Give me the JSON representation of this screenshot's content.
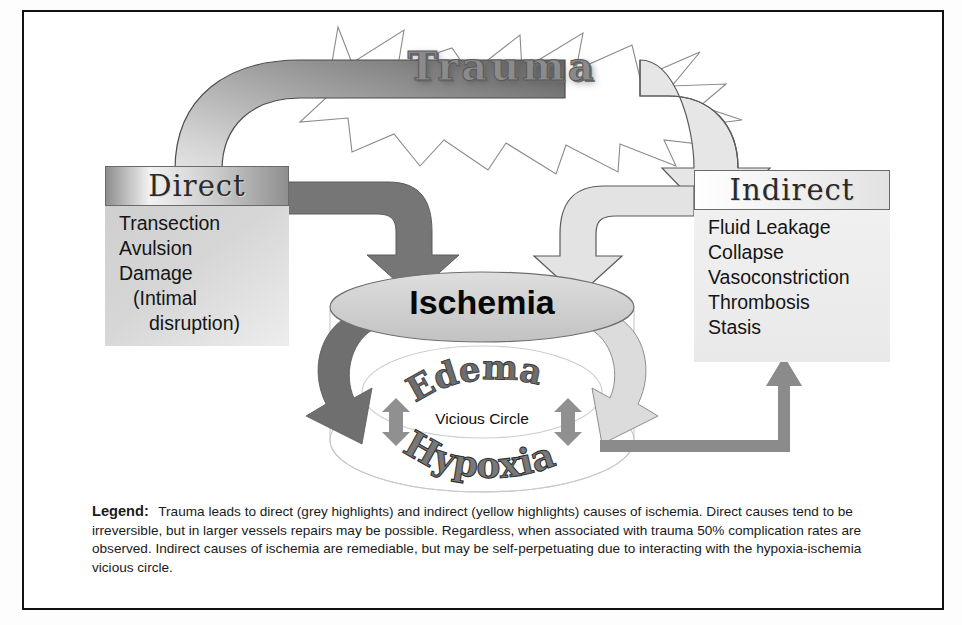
{
  "title": {
    "text": "Trauma"
  },
  "direct": {
    "header": "Direct",
    "items": [
      "Transection",
      "Avulsion",
      "Damage",
      "(Intimal",
      "disruption)"
    ]
  },
  "indirect": {
    "header": "Indirect",
    "items": [
      "Fluid Leakage",
      "Collapse",
      "Vasoconstriction",
      "Thrombosis",
      "Stasis"
    ]
  },
  "center": {
    "ischemia": "Ischemia",
    "edema": "Edema",
    "hypoxia": "Hypoxia",
    "vicious_circle": "Vicious Circle"
  },
  "legend": {
    "label": "Legend:",
    "text": "Trauma leads to direct (grey highlights) and indirect (yellow highlights) causes of ischemia.  Direct causes tend to be irreversible, but in larger vessels repairs may be possible.  Regardless, when associated with trauma 50% complication rates are observed.  Indirect causes of ischemia are remediable, but may be self-perpetuating due to interacting with the hypoxia-ischemia vicious circle."
  },
  "colors": {
    "dark_gray": "#6e6e6e",
    "mid_gray": "#8e8e8e",
    "light_gray": "#dcdcdc",
    "ellipse_fill": "#cfcfcf",
    "border": "#111111"
  }
}
